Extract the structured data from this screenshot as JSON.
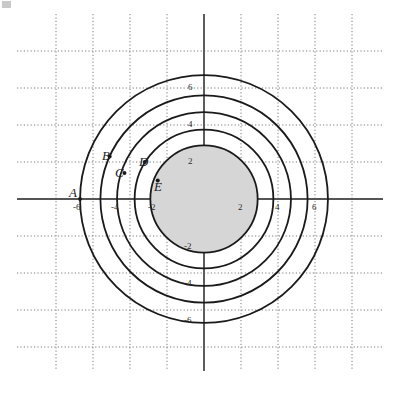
{
  "figure": {
    "title": "",
    "background_color": "#ffffff",
    "width": 399,
    "height": 393
  },
  "chart_data": {
    "type": "scatter",
    "title": "",
    "xlabel": "",
    "ylabel": "",
    "xlim": [
      -8,
      8
    ],
    "ylim": [
      -8,
      8
    ],
    "grid": true,
    "grid_style": "dotted",
    "grid_color": "#7a7a7a",
    "legend": "none",
    "axis_color": "#555555",
    "x_ticks": [
      -6,
      -4,
      -2,
      2,
      4,
      6
    ],
    "x_tick_labels": [
      "-6",
      "-4",
      "-2",
      "2",
      "4",
      "6"
    ],
    "y_ticks": [
      6,
      4,
      2,
      -2,
      -4,
      -6
    ],
    "y_tick_labels": [
      "6",
      "4",
      "2",
      "-2",
      "-4",
      "-6"
    ],
    "origin": {
      "x": 0,
      "y": 0
    },
    "circles": [
      {
        "id": "A",
        "center": [
          0,
          0
        ],
        "radius": 6.7,
        "stroke": "#1a1a1a",
        "fill": "none",
        "stroke_width": 1.8
      },
      {
        "id": "B",
        "center": [
          0,
          0
        ],
        "radius": 5.6,
        "stroke": "#1a1a1a",
        "fill": "none",
        "stroke_width": 1.8
      },
      {
        "id": "C",
        "center": [
          0,
          0
        ],
        "radius": 4.7,
        "stroke": "#1a1a1a",
        "fill": "none",
        "stroke_width": 1.8
      },
      {
        "id": "D",
        "center": [
          0,
          0
        ],
        "radius": 3.75,
        "stroke": "#1a1a1a",
        "fill": "none",
        "stroke_width": 1.8
      },
      {
        "id": "E",
        "center": [
          0,
          0
        ],
        "radius": 2.9,
        "stroke": "#1a1a1a",
        "fill": "#d6d6d6",
        "stroke_width": 1.8
      }
    ],
    "points": [
      {
        "label": "A",
        "x": -6.7,
        "y": 0
      },
      {
        "label": "B",
        "x": -5.1,
        "y": 2.3
      },
      {
        "label": "C",
        "x": -4.3,
        "y": 1.4
      },
      {
        "label": "D",
        "x": -3.2,
        "y": 2.0
      },
      {
        "label": "E",
        "x": -2.5,
        "y": 1.0
      }
    ]
  },
  "labels": {
    "points": [
      {
        "name": "A",
        "text": "A",
        "left": 69,
        "top": 186
      },
      {
        "name": "B",
        "text": "B",
        "left": 102,
        "top": 149
      },
      {
        "name": "C",
        "text": "C",
        "left": 115,
        "top": 166
      },
      {
        "name": "D",
        "text": "D",
        "left": 139,
        "top": 155
      },
      {
        "name": "E",
        "text": "E",
        "left": 154,
        "top": 180
      }
    ],
    "x_ticks": [
      {
        "name": "x-tick-minus6",
        "text": "-6",
        "left": 73,
        "top": 203
      },
      {
        "name": "x-tick-minus4",
        "text": "-4",
        "left": 111,
        "top": 203
      },
      {
        "name": "x-tick-minus2",
        "text": "-2",
        "left": 148,
        "top": 203
      },
      {
        "name": "x-tick-2",
        "text": "2",
        "left": 238,
        "top": 203
      },
      {
        "name": "x-tick-4",
        "text": "4",
        "left": 275,
        "top": 203
      },
      {
        "name": "x-tick-6",
        "text": "6",
        "left": 312,
        "top": 203
      }
    ],
    "y_ticks": [
      {
        "name": "y-tick-6",
        "text": "6",
        "left": 188,
        "top": 83
      },
      {
        "name": "y-tick-4",
        "text": "4",
        "left": 188,
        "top": 120
      },
      {
        "name": "y-tick-2",
        "text": "2",
        "left": 188,
        "top": 157
      },
      {
        "name": "y-tick-minus2",
        "text": "-2",
        "left": 184,
        "top": 242
      },
      {
        "name": "y-tick-minus4",
        "text": "-4",
        "left": 184,
        "top": 279
      },
      {
        "name": "y-tick-minus6",
        "text": "-6",
        "left": 184,
        "top": 316
      }
    ]
  }
}
